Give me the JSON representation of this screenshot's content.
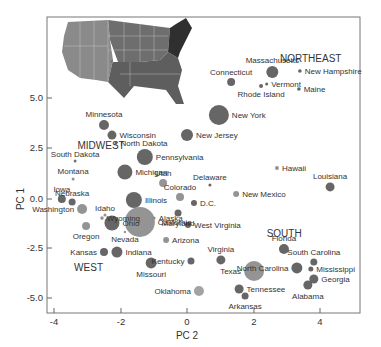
{
  "chart_data": {
    "type": "scatter",
    "title": "",
    "xlabel": "PC 2",
    "ylabel": "PC 1",
    "xlim": [
      -4.2,
      5.2
    ],
    "ylim": [
      -5.7,
      9.1
    ],
    "xticks": [
      -4,
      -2,
      0,
      2,
      4
    ],
    "xtick_labels": [
      "-4",
      "-2",
      "0",
      "2",
      "4"
    ],
    "yticks": [
      5.0,
      2.5,
      0.0,
      -2.5,
      -5.0
    ],
    "ytick_labels": [
      "5.0",
      "2.5",
      "0.0",
      "-2.5",
      "-5.0"
    ],
    "grid": false,
    "legend": "none",
    "inset": "US map colored by region (West, Midwest, South, Northeast) in grayscale, upper-left",
    "region_labels": [
      {
        "text": "NORTHEAST",
        "x": 2.8,
        "y": 6.8
      },
      {
        "text": "MIDWEST",
        "x": -3.3,
        "y": 2.5
      },
      {
        "text": "SOUTH",
        "x": 2.4,
        "y": -1.9
      },
      {
        "text": "WEST",
        "x": -3.4,
        "y": -3.6
      }
    ],
    "points": [
      {
        "label": "Massachusetts",
        "x": 2.57,
        "y": 6.32,
        "size": 6,
        "shade": "#555555"
      },
      {
        "label": "Connecticut",
        "x": 1.33,
        "y": 5.82,
        "size": 4,
        "shade": "#555555"
      },
      {
        "label": "Vermont",
        "x": 2.4,
        "y": 5.72,
        "size": 1.5,
        "shade": "#555555"
      },
      {
        "label": "Rhode Island",
        "x": 2.23,
        "y": 5.62,
        "size": 2,
        "shade": "#555555"
      },
      {
        "label": "New Hampshire",
        "x": 3.4,
        "y": 6.37,
        "size": 1.8,
        "shade": "#555555"
      },
      {
        "label": "Maine",
        "x": 3.37,
        "y": 5.47,
        "size": 1.8,
        "shade": "#555555"
      },
      {
        "label": "New York",
        "x": 0.96,
        "y": 4.18,
        "size": 10,
        "shade": "#555555"
      },
      {
        "label": "New Jersey",
        "x": 0.0,
        "y": 3.18,
        "size": 6,
        "shade": "#555555"
      },
      {
        "label": "Minnesota",
        "x": -2.5,
        "y": 3.68,
        "size": 5,
        "shade": "#555555"
      },
      {
        "label": "Wisconsin",
        "x": -2.26,
        "y": 3.18,
        "size": 4.5,
        "shade": "#555555"
      },
      {
        "label": "North Dakota",
        "x": -2.14,
        "y": 2.79,
        "size": 1.5,
        "shade": "#555555"
      },
      {
        "label": "Pennsylvania",
        "x": -1.27,
        "y": 2.09,
        "size": 8,
        "shade": "#555555"
      },
      {
        "label": "Michigan",
        "x": -1.87,
        "y": 1.34,
        "size": 7.5,
        "shade": "#555555"
      },
      {
        "label": "South Dakota",
        "x": -3.37,
        "y": 1.89,
        "size": 1.5,
        "shade": "#666666"
      },
      {
        "label": "Montana",
        "x": -3.43,
        "y": 1.0,
        "size": 1.5,
        "shade": "#888888"
      },
      {
        "label": "Utah",
        "x": -0.72,
        "y": 0.8,
        "size": 4,
        "shade": "#888888"
      },
      {
        "label": "Delaware",
        "x": 0.69,
        "y": 0.7,
        "size": 1.5,
        "shade": "#555555"
      },
      {
        "label": "Hawaii",
        "x": 2.71,
        "y": 1.54,
        "size": 2,
        "shade": "#888888"
      },
      {
        "label": "Louisiana",
        "x": 4.31,
        "y": 0.6,
        "size": 4.5,
        "shade": "#555555"
      },
      {
        "label": "Colorado",
        "x": -0.21,
        "y": 0.1,
        "size": 4,
        "shade": "#888888"
      },
      {
        "label": "New Mexico",
        "x": 1.48,
        "y": 0.25,
        "size": 3,
        "shade": "#888888"
      },
      {
        "label": "D.C.",
        "x": 0.21,
        "y": -0.2,
        "size": 3,
        "shade": "#555555"
      },
      {
        "label": "Iowa",
        "x": -3.77,
        "y": 0.0,
        "size": 4,
        "shade": "#555555"
      },
      {
        "label": "Nebraska",
        "x": -3.46,
        "y": -0.15,
        "size": 3.5,
        "shade": "#555555"
      },
      {
        "label": "Illinois",
        "x": -1.6,
        "y": -0.05,
        "size": 8,
        "shade": "#555555"
      },
      {
        "label": "Idaho",
        "x": -2.47,
        "y": -0.8,
        "size": 1.5,
        "shade": "#888888"
      },
      {
        "label": "Maryland",
        "x": -0.27,
        "y": -0.7,
        "size": 3.5,
        "shade": "#555555"
      },
      {
        "label": "Washington",
        "x": -3.16,
        "y": -0.5,
        "size": 5,
        "shade": "#888888"
      },
      {
        "label": "Wyoming",
        "x": -2.56,
        "y": -0.95,
        "size": 1.8,
        "shade": "#888888"
      },
      {
        "label": "Alaska",
        "x": -0.99,
        "y": -0.95,
        "size": 1.5,
        "shade": "#888888"
      },
      {
        "label": "California",
        "x": -1.42,
        "y": -1.14,
        "size": 15,
        "shade": "#888888"
      },
      {
        "label": "Ohio",
        "x": -2.26,
        "y": -1.19,
        "size": 7.5,
        "shade": "#555555"
      },
      {
        "label": "Oregon",
        "x": -3.04,
        "y": -1.34,
        "size": 4,
        "shade": "#888888"
      },
      {
        "label": "West Virginia",
        "x": 0.03,
        "y": -1.29,
        "size": 3,
        "shade": "#555555"
      },
      {
        "label": "Nevada",
        "x": -1.87,
        "y": -1.64,
        "size": 1.2,
        "shade": "#888888"
      },
      {
        "label": "Arizona",
        "x": -0.63,
        "y": -2.04,
        "size": 3,
        "shade": "#888888"
      },
      {
        "label": "Kansas",
        "x": -2.5,
        "y": -2.64,
        "size": 4,
        "shade": "#555555"
      },
      {
        "label": "Indiana",
        "x": -2.11,
        "y": -2.64,
        "size": 5.5,
        "shade": "#555555"
      },
      {
        "label": "Missouri",
        "x": -1.08,
        "y": -3.18,
        "size": 5.5,
        "shade": "#555555"
      },
      {
        "label": "Kentucky",
        "x": 0.12,
        "y": -3.08,
        "size": 3.5,
        "shade": "#555555"
      },
      {
        "label": "Virginia",
        "x": 1.02,
        "y": -3.03,
        "size": 4.5,
        "shade": "#555555"
      },
      {
        "label": "Texas",
        "x": 2.02,
        "y": -3.58,
        "size": 10,
        "shade": "#888888"
      },
      {
        "label": "Florida",
        "x": 2.92,
        "y": -2.49,
        "size": 5,
        "shade": "#555555"
      },
      {
        "label": "North Carolina",
        "x": 3.31,
        "y": -3.43,
        "size": 5.5,
        "shade": "#555555"
      },
      {
        "label": "South Carolina",
        "x": 3.82,
        "y": -3.13,
        "size": 3.5,
        "shade": "#555555"
      },
      {
        "label": "Mississippi",
        "x": 3.73,
        "y": -3.48,
        "size": 2.5,
        "shade": "#555555"
      },
      {
        "label": "Georgia",
        "x": 3.82,
        "y": -3.98,
        "size": 4.5,
        "shade": "#555555"
      },
      {
        "label": "Alabama",
        "x": 3.64,
        "y": -4.28,
        "size": 4.5,
        "shade": "#555555"
      },
      {
        "label": "Oklahoma",
        "x": 0.36,
        "y": -4.58,
        "size": 5,
        "shade": "#999999"
      },
      {
        "label": "Tennessee",
        "x": 1.57,
        "y": -4.48,
        "size": 4.5,
        "shade": "#555555"
      },
      {
        "label": "Arkansas",
        "x": 1.75,
        "y": -4.83,
        "size": 3.5,
        "shade": "#555555"
      }
    ]
  }
}
